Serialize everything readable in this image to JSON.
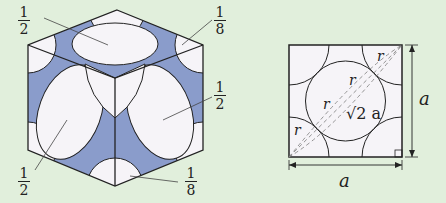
{
  "figure": {
    "left_diagram": {
      "description": "face-centered cubic unit cell with spheres",
      "labels": [
        {
          "id": "top-face",
          "num": "1",
          "den": "2"
        },
        {
          "id": "top-right-corner",
          "num": "1",
          "den": "8"
        },
        {
          "id": "right-face",
          "num": "1",
          "den": "2"
        },
        {
          "id": "left-face",
          "num": "1",
          "den": "2"
        },
        {
          "id": "bottom-corner",
          "num": "1",
          "den": "8"
        }
      ]
    },
    "right_diagram": {
      "description": "face of unit cell showing diagonal",
      "radius_label": "r",
      "diagonal_label": "√2 a",
      "side_label_bottom": "a",
      "side_label_right": "a"
    },
    "colors": {
      "background": "#e1efdc",
      "sphere_fill": "#f6f4f8",
      "gap_fill": "#8a9ccb",
      "line": "#222222"
    }
  }
}
